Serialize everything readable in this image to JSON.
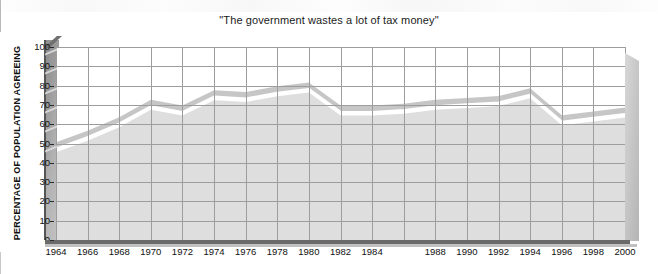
{
  "chart_data": {
    "type": "area",
    "title": "\"The government wastes a lot of tax money\"",
    "xlabel": "",
    "ylabel": "PERCENTAGE OF POPULATION AGREEING",
    "ylim": [
      0,
      100
    ],
    "ytick_step": 10,
    "yticks": [
      "100",
      "90",
      "80",
      "70",
      "60",
      "50",
      "40",
      "30",
      "20",
      "10",
      "0"
    ],
    "xticks": [
      "1964",
      "1966",
      "1968",
      "1970",
      "1972",
      "1974",
      "1976",
      "1978",
      "1980",
      "1982",
      "1984",
      "1988",
      "1990",
      "1992",
      "1994",
      "1996",
      "1998",
      "2000"
    ],
    "xlim": [
      1964,
      2000
    ],
    "grid": true,
    "legend": "none",
    "style": "3d-area",
    "series": [
      {
        "name": "Percentage agreeing",
        "x": [
          1964,
          1966,
          1968,
          1970,
          1972,
          1974,
          1976,
          1978,
          1980,
          1982,
          1984,
          1986,
          1988,
          1990,
          1992,
          1994,
          1996,
          1998,
          2000
        ],
        "values": [
          47,
          53,
          60,
          69,
          66,
          74,
          73,
          76,
          78,
          66,
          66,
          67,
          69,
          70,
          71,
          75,
          61,
          63,
          65
        ]
      }
    ],
    "colors": {
      "band_top": "#c9c9c9",
      "area_fill": "#dcdcdc",
      "highlight_line": "#ffffff",
      "grid": "#9d9d9f",
      "axis": "#2a2a2a",
      "text": "#111111",
      "wall_left": "#9a9a9a",
      "wall_right": "#c2c2c2"
    }
  }
}
